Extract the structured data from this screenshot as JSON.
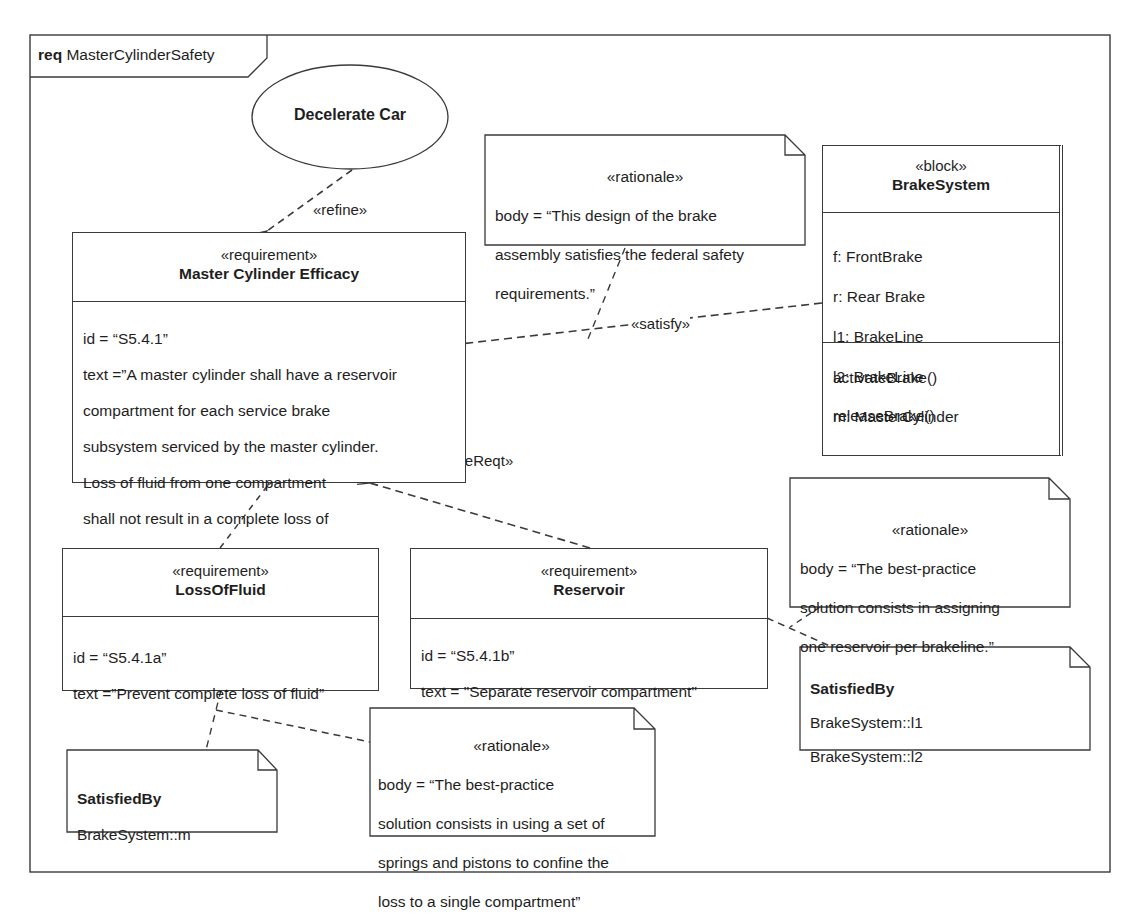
{
  "frame": {
    "kind": "req",
    "name": "MasterCylinderSafety"
  },
  "use_case": {
    "name": "Decelerate Car"
  },
  "requirements": {
    "master": {
      "stereotype": "«requirement»",
      "name": "Master Cylinder Efficacy",
      "id_line": "id = “S5.4.1”",
      "text_lines": [
        "text =”A master cylinder shall have a reservoir",
        "compartment for each service brake",
        "subsystem serviced by the master cylinder.",
        "Loss of fluid from one compartment",
        "shall not result in a complete loss of",
        "brake fluid from another compartment.”"
      ]
    },
    "loss_of_fluid": {
      "stereotype": "«requirement»",
      "name": "LossOfFluid",
      "id_line": "id = “S5.4.1a”",
      "text_line": "text =”Prevent complete loss of fluid”"
    },
    "reservoir": {
      "stereotype": "«requirement»",
      "name": "Reservoir",
      "id_line": "id = “S5.4.1b”",
      "text_line": "text = \"Separate reservoir compartment\""
    }
  },
  "block": {
    "stereotype": "«block»",
    "name": "BrakeSystem",
    "parts": [
      "f: FrontBrake",
      "r: Rear Brake",
      "l1: BrakeLine",
      "l2: BrakeLine",
      "m: MasterCylinder"
    ],
    "operations": [
      "activateBrake()",
      "releaseBrake()"
    ]
  },
  "rationales": {
    "federal": {
      "stereotype": "«rationale»",
      "lines": [
        "body = “This design of the brake",
        "assembly satisfies the federal safety",
        "requirements.”"
      ]
    },
    "brakeline": {
      "stereotype": "«rationale»",
      "lines": [
        "body = “The best-practice",
        "solution consists in assigning",
        "one reservoir per brakeline.”"
      ]
    },
    "springs": {
      "stereotype": "«rationale»",
      "lines": [
        "body = “The best-practice",
        "solution consists in using a set of",
        "springs and pistons to confine the",
        "loss to a single compartment”"
      ]
    }
  },
  "satisfied_by": {
    "lines_note": {
      "title": "SatisfiedBy",
      "items": [
        "BrakeSystem::l1",
        "BrakeSystem::l2"
      ]
    },
    "master_note": {
      "title": "SatisfiedBy",
      "items": [
        "BrakeSystem::m"
      ]
    }
  },
  "relationships": {
    "refine": "«refine»",
    "satisfy": "«satisfy»",
    "derive_left": "«deriveReqt»",
    "derive_right": "«deriveReqt»"
  },
  "colors": {
    "line": "#3a3a3a",
    "text": "#1e1e1e",
    "background": "#ffffff"
  }
}
